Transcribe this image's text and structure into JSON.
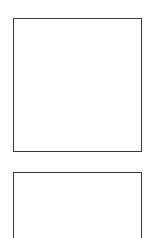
{
  "canvas": {
    "width": 149,
    "height": 238,
    "background_color": "#ffffff"
  },
  "theme": {
    "page_background": "#ffffff",
    "panel_background": "#ffffff",
    "panel_border_color": "#3a3a3a",
    "panel_border_width_px": 1
  },
  "panels": [
    {
      "id": "primary",
      "name": "upper-panel",
      "x": 13,
      "y": 18,
      "width": 129,
      "height": 134,
      "content": "",
      "clipped": false
    },
    {
      "id": "secondary",
      "name": "lower-panel",
      "x": 13,
      "y": 172,
      "width": 129,
      "height": 80,
      "content": "",
      "clipped": true
    }
  ]
}
